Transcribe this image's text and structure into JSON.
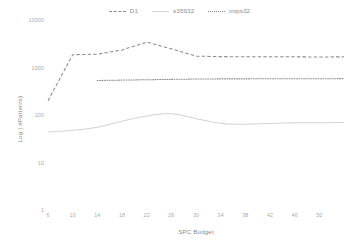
{
  "chart_data": {
    "type": "line",
    "title": "",
    "xlabel": "SPC Budget",
    "ylabel": "Log ( #Patterns)",
    "yscale": "log",
    "ylim": [
      1,
      10000
    ],
    "xlim": [
      6,
      54
    ],
    "grid": false,
    "legend_position": "top-center",
    "ytick_labels": [
      "10000",
      "1000",
      "100",
      "10",
      "1"
    ],
    "ytick_values": [
      10000,
      1000,
      100,
      10,
      1
    ],
    "xtick_labels": [
      "6",
      "10",
      "14",
      "18",
      "22",
      "26",
      "30",
      "34",
      "38",
      "42",
      "46",
      "50",
      ""
    ],
    "xtick_values": [
      6,
      10,
      14,
      18,
      22,
      26,
      30,
      34,
      38,
      42,
      46,
      50,
      54
    ],
    "series": [
      {
        "name": "D1",
        "style": "dashed",
        "color": "#8c8c8c",
        "x": [
          6,
          10,
          14,
          18,
          22,
          26,
          30,
          34,
          38,
          42,
          46,
          50,
          54
        ],
        "values": [
          210,
          1950,
          2000,
          2450,
          3600,
          2600,
          1820,
          1780,
          1770,
          1760,
          1760,
          1750,
          1760
        ]
      },
      {
        "name": "s35932",
        "style": "solid",
        "color": "#d2d2d2",
        "x": [
          6,
          10,
          14,
          18,
          22,
          26,
          30,
          34,
          38,
          42,
          46,
          50,
          54
        ],
        "values": [
          46,
          50,
          58,
          78,
          100,
          112,
          88,
          70,
          67,
          70,
          72,
          72,
          73
        ]
      },
      {
        "name": "mips32",
        "style": "dotted",
        "color": "#8c8c8c",
        "x": [
          14,
          18,
          22,
          26,
          30,
          34,
          38,
          42,
          46,
          50,
          54
        ],
        "values": [
          560,
          570,
          580,
          590,
          600,
          605,
          605,
          608,
          610,
          610,
          612
        ]
      }
    ]
  }
}
